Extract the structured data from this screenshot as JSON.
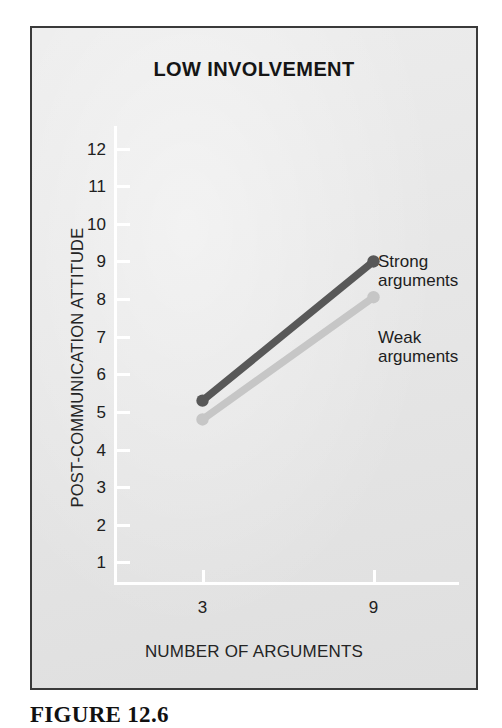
{
  "figure": {
    "caption": "FIGURE 12.6",
    "frame_border_color": "#3a3a3a",
    "plate_background": "#e7e7e7"
  },
  "chart_data": {
    "type": "line",
    "title": "LOW INVOLVEMENT",
    "xlabel": "NUMBER OF ARGUMENTS",
    "ylabel": "POST-COMMUNICATION ATTITUDE",
    "x": [
      3,
      9
    ],
    "xtick_labels": [
      "3",
      "9"
    ],
    "ytick_labels": [
      "1",
      "2",
      "3",
      "4",
      "5",
      "6",
      "7",
      "8",
      "9",
      "10",
      "11",
      "12"
    ],
    "ylim": [
      0.4,
      12.6
    ],
    "xlim": [
      0,
      12
    ],
    "grid": false,
    "legend_position": "inline-right",
    "series": [
      {
        "name": "Strong\narguments",
        "label_line1": "Strong",
        "label_line2": "arguments",
        "values": [
          5.3,
          9.0
        ],
        "color": "#585858",
        "marker": "circle"
      },
      {
        "name": "Weak\narguments",
        "label_line1": "Weak",
        "label_line2": "arguments",
        "values": [
          4.8,
          8.05
        ],
        "color": "#c6c6c6",
        "marker": "circle"
      }
    ],
    "axis_color": "#ffffff",
    "tick_label_color": "#202020"
  }
}
